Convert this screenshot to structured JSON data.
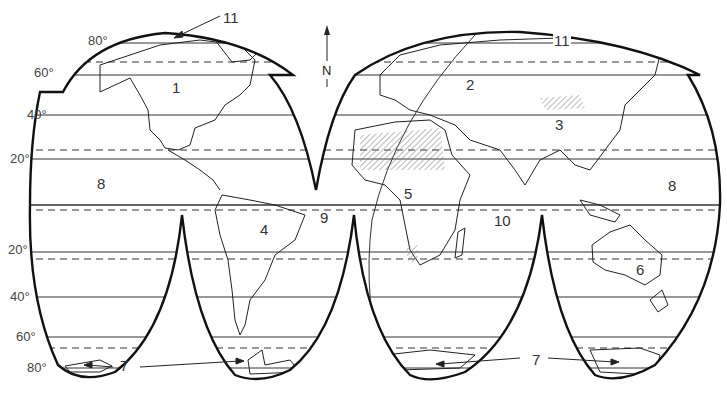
{
  "map": {
    "type": "interrupted world projection (outline map)",
    "north_indicator": {
      "letter": "N",
      "icon": "north-arrow-icon"
    },
    "latitude_labels": [
      {
        "text": "80°",
        "x": 88,
        "y": 34
      },
      {
        "text": "60°",
        "x": 34,
        "y": 66
      },
      {
        "text": "40°",
        "x": 27,
        "y": 108
      },
      {
        "text": "20°",
        "x": 10,
        "y": 152
      },
      {
        "text": "20°",
        "x": 8,
        "y": 243
      },
      {
        "text": "40°",
        "x": 10,
        "y": 290
      },
      {
        "text": "60°",
        "x": 16,
        "y": 330
      },
      {
        "text": "80°",
        "x": 27,
        "y": 361
      }
    ],
    "region_labels": [
      {
        "id": "1",
        "text": "1",
        "x": 172,
        "y": 80
      },
      {
        "id": "2",
        "text": "2",
        "x": 466,
        "y": 77
      },
      {
        "id": "3",
        "text": "3",
        "x": 555,
        "y": 117
      },
      {
        "id": "4",
        "text": "4",
        "x": 260,
        "y": 222
      },
      {
        "id": "5",
        "text": "5",
        "x": 404,
        "y": 186
      },
      {
        "id": "6",
        "text": "6",
        "x": 636,
        "y": 262
      },
      {
        "id": "7a",
        "text": "7",
        "x": 120,
        "y": 358
      },
      {
        "id": "7b",
        "text": "7",
        "x": 532,
        "y": 352
      },
      {
        "id": "8a",
        "text": "8",
        "x": 97,
        "y": 176
      },
      {
        "id": "8b",
        "text": "8",
        "x": 668,
        "y": 178
      },
      {
        "id": "9",
        "text": "9",
        "x": 320,
        "y": 210
      },
      {
        "id": "10",
        "text": "10",
        "x": 494,
        "y": 213
      },
      {
        "id": "11a",
        "text": "11",
        "x": 223,
        "y": 10
      },
      {
        "id": "11b",
        "text": "11",
        "x": 553,
        "y": 33
      }
    ],
    "colors": {
      "ink": "#222222",
      "background": "#ffffff",
      "hatch": "#666666"
    }
  }
}
